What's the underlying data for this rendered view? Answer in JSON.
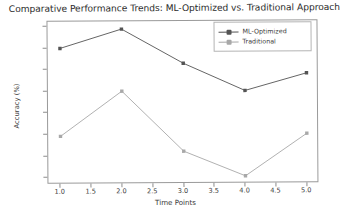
{
  "chart_data": {
    "type": "line",
    "title": "Comparative Performance Trends: ML-Optimized vs. Traditional Approach",
    "xlabel": "Time Points",
    "ylabel": "Accuracy (%)",
    "x": [
      1.0,
      2.0,
      3.0,
      4.0,
      5.0
    ],
    "xticks": [
      "1.0",
      "1.5",
      "2.0",
      "2.5",
      "3.0",
      "3.5",
      "4.0",
      "4.5",
      "5.0"
    ],
    "xtick_values": [
      1.0,
      1.5,
      2.0,
      2.5,
      3.0,
      3.5,
      4.0,
      4.5,
      5.0
    ],
    "yticks": [
      "75.0",
      "77.5",
      "80.0",
      "82.5",
      "85.0",
      "87.5",
      "90.0",
      "92.5"
    ],
    "ytick_values": [
      75.0,
      77.5,
      80.0,
      82.5,
      85.0,
      87.5,
      90.0,
      92.5
    ],
    "xlim": [
      0.8,
      5.2
    ],
    "ylim": [
      74.2,
      93.1
    ],
    "grid": false,
    "legend_position": "upper right",
    "series": [
      {
        "name": "ML-Optimized",
        "color": "#545454",
        "marker": "square",
        "values": [
          90.0,
          92.2,
          88.2,
          85.0,
          87.0
        ]
      },
      {
        "name": "Traditional",
        "color": "#a8a8a8",
        "marker": "square",
        "values": [
          79.8,
          85.0,
          78.0,
          75.1,
          80.0
        ]
      }
    ]
  },
  "colors": {
    "axis": "#9a9a9a",
    "text": "#3a3a3a",
    "title": "#2b2b2b",
    "background": "#ffffff"
  }
}
